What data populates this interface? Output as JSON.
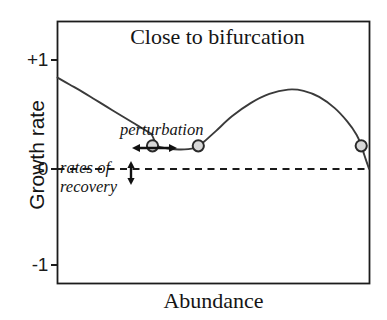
{
  "chart_data": {
    "type": "line",
    "title": "Close to bifurcation",
    "xlabel": "Abundance",
    "ylabel": "Growth rate",
    "xlim": [
      0,
      1
    ],
    "ylim": [
      -1.35,
      1.22
    ],
    "grid": false,
    "legend": null,
    "yticks": [
      {
        "value": 1,
        "label": "+1"
      },
      {
        "value": 0,
        "label": "0"
      },
      {
        "value": -1,
        "label": "-1"
      }
    ],
    "xticks": [],
    "zero_line": {
      "value": 0,
      "style": "dashed"
    },
    "series": [
      {
        "name": "growth rate curve",
        "points": [
          [
            0.0,
            0.67
          ],
          [
            0.04,
            0.6
          ],
          [
            0.08,
            0.53
          ],
          [
            0.12,
            0.455
          ],
          [
            0.16,
            0.38
          ],
          [
            0.2,
            0.305
          ],
          [
            0.24,
            0.232
          ],
          [
            0.27,
            0.175
          ],
          [
            0.3,
            0.118
          ],
          [
            0.31,
            0.06
          ],
          [
            0.318,
            0.008
          ],
          [
            0.33,
            -0.012
          ],
          [
            0.36,
            -0.028
          ],
          [
            0.39,
            -0.035
          ],
          [
            0.42,
            -0.032
          ],
          [
            0.44,
            -0.022
          ],
          [
            0.452,
            -0.005
          ],
          [
            0.47,
            0.04
          ],
          [
            0.51,
            0.15
          ],
          [
            0.56,
            0.29
          ],
          [
            0.62,
            0.42
          ],
          [
            0.68,
            0.51
          ],
          [
            0.74,
            0.552
          ],
          [
            0.79,
            0.54
          ],
          [
            0.84,
            0.48
          ],
          [
            0.89,
            0.37
          ],
          [
            0.93,
            0.24
          ],
          [
            0.96,
            0.11
          ],
          [
            0.975,
            0.005
          ],
          [
            0.985,
            -0.09
          ],
          [
            1.0,
            -0.225
          ]
        ]
      }
    ],
    "markers": [
      {
        "x": 0.305,
        "y": 0.0,
        "label": "stable equilibrium left",
        "shape": "circle"
      },
      {
        "x": 0.452,
        "y": 0.0,
        "label": "unstable equilibrium",
        "shape": "circle"
      },
      {
        "x": 0.975,
        "y": 0.0,
        "label": "equilibrium right",
        "shape": "circle"
      }
    ],
    "annotations": [
      {
        "name": "perturbation-label",
        "text": "perturbation",
        "style": "italic"
      },
      {
        "name": "rates-of-recovery-line1",
        "text": "rates of",
        "style": "italic"
      },
      {
        "name": "rates-of-recovery-line2",
        "text": "recovery",
        "style": "italic"
      },
      {
        "name": "perturbation-arrow",
        "text": "",
        "type": "double-headed-horizontal-arrow"
      },
      {
        "name": "recovery-rate-arrow",
        "text": "",
        "type": "double-headed-vertical-arrow"
      }
    ],
    "colors": {
      "curve": "#3a3a3a",
      "axis": "#1c1c1c",
      "zero_line": "#1a1a1a",
      "marker_fill": "#d8d8d8",
      "marker_stroke": "#2a2a2a",
      "arrow": "#111111",
      "background": "#ffffff"
    }
  }
}
